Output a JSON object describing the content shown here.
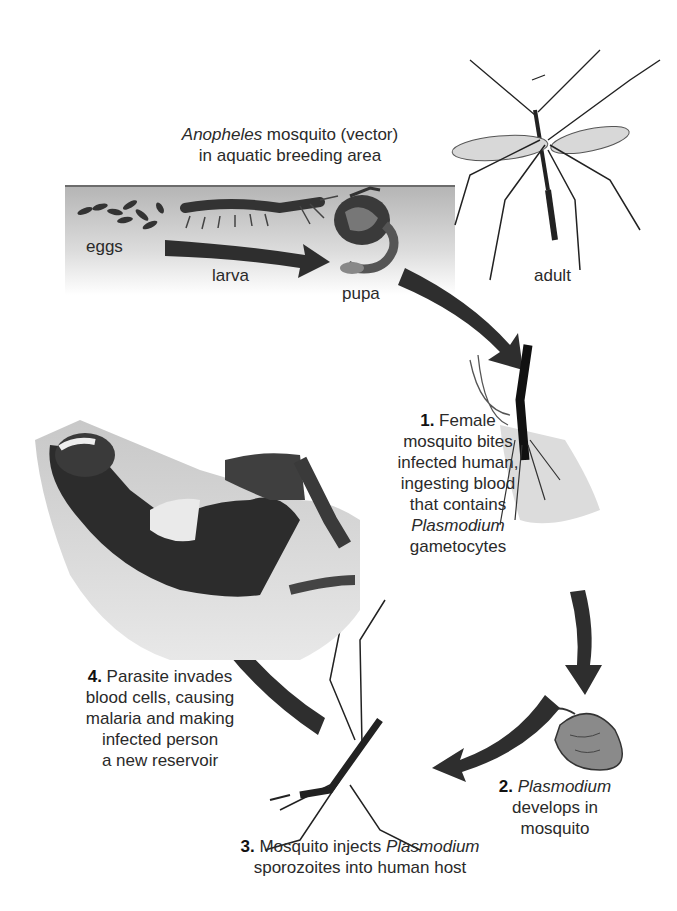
{
  "title": {
    "line1_italic": "Anopheles",
    "line1_rest": " mosquito (vector)",
    "line2": "in aquatic breeding area"
  },
  "stages": {
    "eggs": "eggs",
    "larva": "larva",
    "pupa": "pupa",
    "adult": "adult"
  },
  "steps": [
    {
      "number": "1.",
      "lines": [
        "Female",
        "mosquito bites",
        "infected human,",
        "ingesting blood",
        "that contains"
      ],
      "italic_line": "Plasmodium",
      "last_line": "gametocytes"
    },
    {
      "number": "2.",
      "italic_first": "Plasmodium",
      "lines": [
        "develops in",
        "mosquito"
      ]
    },
    {
      "number": "3.",
      "first_text": "Mosquito injects ",
      "italic_word": "Plasmodium",
      "line2": "sporozoites into human host"
    },
    {
      "number": "4.",
      "first_text": "Parasite invades",
      "lines": [
        "blood cells, causing",
        "malaria and making",
        "infected person",
        "a new reservoir"
      ]
    }
  ],
  "colors": {
    "arrow": "#2e2e2e",
    "band_dark": "#b9b9b9",
    "band_light": "#f4f4f4",
    "text": "#2a2a2a"
  }
}
